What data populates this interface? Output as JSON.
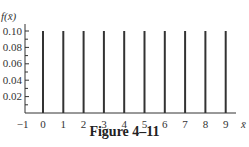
{
  "chart_data": {
    "type": "bar",
    "title": "",
    "caption": "Figure 4–11",
    "xlabel": "x̄",
    "ylabel": "f(x̄)",
    "x": [
      0,
      1,
      2,
      3,
      4,
      5,
      6,
      7,
      8,
      9
    ],
    "values": [
      0.1,
      0.1,
      0.1,
      0.1,
      0.1,
      0.1,
      0.1,
      0.1,
      0.1,
      0.1
    ],
    "x_ticks": [
      "−1",
      "0",
      "1",
      "2",
      "3",
      "4",
      "5",
      "6",
      "7",
      "8",
      "9"
    ],
    "y_ticks": [
      "0.02",
      "0.04",
      "0.06",
      "0.08",
      "0.10"
    ],
    "ylim": [
      0,
      0.1
    ],
    "xlim": [
      -1,
      9.5
    ],
    "grid": false,
    "bar_style": "vertical lines"
  },
  "colors": {
    "ink": "#333333"
  }
}
